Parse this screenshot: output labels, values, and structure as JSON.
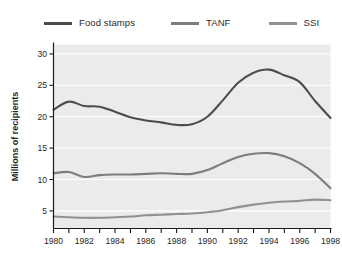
{
  "chart_data": {
    "type": "line",
    "title": "",
    "subtitle": "",
    "xlabel": "",
    "ylabel": "Millions of recipients",
    "xlim": [
      1980,
      1998
    ],
    "ylim": [
      2.2,
      31.5
    ],
    "yticks": [
      5,
      10,
      15,
      20,
      25,
      30
    ],
    "ytick_labels": [
      "5",
      "10",
      "15",
      "20",
      "25",
      "30"
    ],
    "xticks": [
      1980,
      1982,
      1984,
      1986,
      1988,
      1990,
      1992,
      1994,
      1996,
      1998
    ],
    "xtick_labels": [
      "1980",
      "1982",
      "1984",
      "1986",
      "1988",
      "1990",
      "1992",
      "1994",
      "1996",
      "1998"
    ],
    "x_minor_ticks": [
      1981,
      1983,
      1985,
      1987,
      1989,
      1991,
      1993,
      1995,
      1997
    ],
    "grid": "horizontal-white-on-gray",
    "legend_position": "top",
    "plot_background": "#ebebeb",
    "figure_background": "#ffffff",
    "x": [
      1980,
      1981,
      1982,
      1983,
      1984,
      1985,
      1986,
      1987,
      1988,
      1989,
      1990,
      1991,
      1992,
      1993,
      1994,
      1995,
      1996,
      1997,
      1998
    ],
    "series": [
      {
        "name": "Food stamps",
        "color": "#4d4d4d",
        "values": [
          21.1,
          22.4,
          21.7,
          21.6,
          20.8,
          19.9,
          19.4,
          19.1,
          18.7,
          18.8,
          20.0,
          22.6,
          25.4,
          27.0,
          27.5,
          26.6,
          25.5,
          22.5,
          19.8
        ]
      },
      {
        "name": "TANF",
        "color": "#7d7d7d",
        "values": [
          11.0,
          11.2,
          10.4,
          10.7,
          10.8,
          10.8,
          10.9,
          11.0,
          10.9,
          10.9,
          11.5,
          12.6,
          13.6,
          14.1,
          14.2,
          13.7,
          12.6,
          10.9,
          8.6
        ]
      },
      {
        "name": "SSI",
        "color": "#919191",
        "values": [
          4.1,
          4.0,
          3.9,
          3.9,
          4.0,
          4.1,
          4.3,
          4.4,
          4.5,
          4.6,
          4.8,
          5.1,
          5.6,
          6.0,
          6.3,
          6.5,
          6.6,
          6.8,
          6.7
        ]
      }
    ]
  },
  "legend": {
    "entries": [
      {
        "label": "Food stamps",
        "color": "#4d4d4d"
      },
      {
        "label": "TANF",
        "color": "#7d7d7d"
      },
      {
        "label": "SSI",
        "color": "#919191"
      }
    ]
  },
  "axes": {
    "y_title": "Millions of recipients"
  }
}
